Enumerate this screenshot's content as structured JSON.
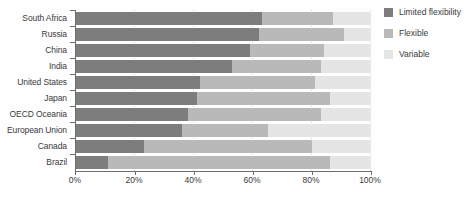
{
  "chart_data": {
    "type": "bar",
    "orientation": "horizontal",
    "stacked": true,
    "title": "",
    "xlabel": "",
    "ylabel": "",
    "categories": [
      "South Africa",
      "Russia",
      "China",
      "India",
      "United States",
      "Japan",
      "OECD Oceania",
      "European Union",
      "Canada",
      "Brazil"
    ],
    "series": [
      {
        "name": "Limited flexibility",
        "color": "#7d7d7d",
        "values": [
          63,
          62,
          59,
          53,
          42,
          41,
          38,
          36,
          23,
          11
        ]
      },
      {
        "name": "Flexible",
        "color": "#b9b9b9",
        "values": [
          24,
          29,
          25,
          30,
          39,
          45,
          45,
          29,
          57,
          75
        ]
      },
      {
        "name": "Variable",
        "color": "#e5e5e5",
        "values": [
          13,
          9,
          16,
          17,
          19,
          14,
          17,
          35,
          20,
          14
        ]
      }
    ],
    "xlim": [
      0,
      100
    ],
    "xticks": [
      {
        "value": 0,
        "label": "0%"
      },
      {
        "value": 20,
        "label": "20%"
      },
      {
        "value": 40,
        "label": "40%"
      },
      {
        "value": 60,
        "label": "60%"
      },
      {
        "value": 80,
        "label": "80%"
      },
      {
        "value": 100,
        "label": "100%"
      }
    ],
    "grid": "vertical-dotted",
    "legend_position": "top-right"
  },
  "colors": {
    "axis": "#6e6e6e",
    "gridline": "#cfcfcf",
    "text": "#3a3a3a",
    "background": "#fefefe"
  }
}
